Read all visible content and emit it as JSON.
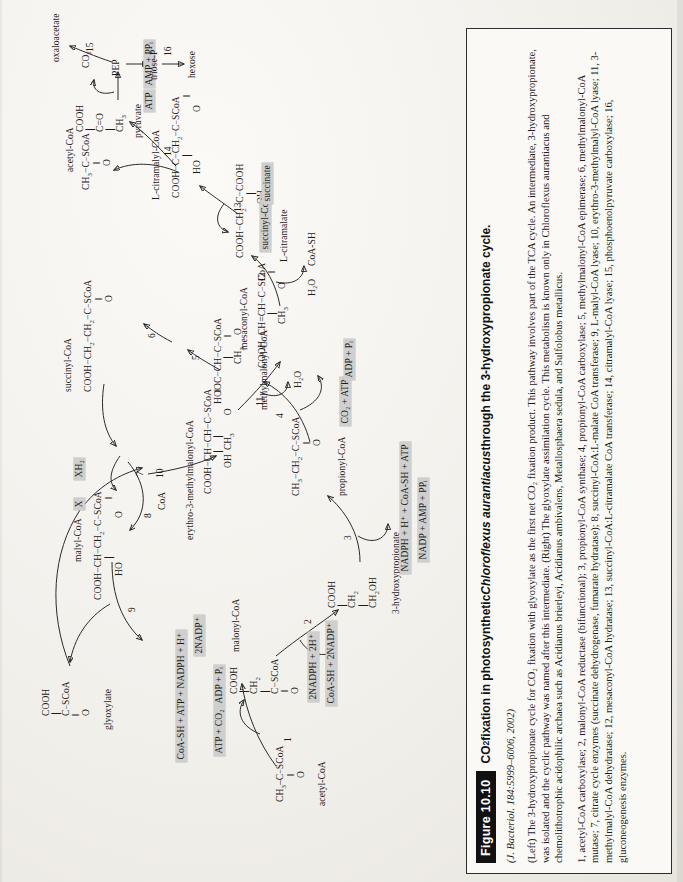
{
  "figure": {
    "badge": "Figure 10.10",
    "title_pre": "CO",
    "title_sub": "2",
    "title_mid": " fixation in photosynthetic ",
    "title_italic": "Chloroflexus aurantiacus",
    "title_post": " through the 3-hydroxypropionate cycle.",
    "source": "(J. Bacteriol. 184:5999–6006, 2002)",
    "paragraph_1": "(Left) The 3-hydroxypropionate cycle for CO₂ fixation with glyoxylate as the first net CO₂ fixation product. This pathway involves part of the TCA cycle. An intermediate, 3-hydroxypropionate, was isolated and the cyclic pathway was named after this intermediate. (Right) The glyoxylate assimilation cycle. This metabolism is known only in Chloroflexus aurantiacus and chemolithotrophic acidophilic archaea such as Acidianus brierleyi, Acidianus ambivalens, Metallosphaera sedula, and Sulfolobus metallicus.",
    "paragraph_2": "1, acetyl-CoA carboxylase; 2, malonyl-CoA reductase (bifunctional); 3, propionyl-CoA synthase; 4, propionyl-CoA carboxylase; 5, methylmalonyl-CoA epimerase; 6, methylmalonyl-CoA mutase; 7, citrate cycle enzymes (succinate dehydrogenase, fumarate hydratase); 8, succinyl-CoA:L-malate CoA transferase; 9, L-malyl-CoA lyase; 10, erythro-3-methylmalyl-CoA lyase; 11, 3-methylmalyl-CoA dehydratase; 12, mesaconyl-CoA hydratase; 13, succinyl-CoA:L-citramalate CoA transferase; 14, citramalyl-CoA lyase; 15, phosphoenolpyruvate carboxylase; 16, gluconeogenesis enzymes."
  },
  "diagram": {
    "metabolites": [
      {
        "id": "acetyl-coa",
        "label": "acetyl-CoA"
      },
      {
        "id": "malonyl-coa",
        "label": "malonyl-CoA"
      },
      {
        "id": "3-hydroxypropionate",
        "label": "3-hydroxypropionate"
      },
      {
        "id": "propionyl-coa",
        "label": "propionyl-CoA"
      },
      {
        "id": "methylmalonyl-coa",
        "label": "methylmalonyl-CoA"
      },
      {
        "id": "succinyl-coa",
        "label": "succinyl-CoA"
      },
      {
        "id": "malyl-coa",
        "label": "malyl-CoA"
      },
      {
        "id": "glyoxylate",
        "label": "glyoxylate"
      },
      {
        "id": "erythro-3-methylmalonyl-coa",
        "label": "erythro-3-methylmalonyl-CoA"
      },
      {
        "id": "mesaconyl-coa",
        "label": "mesaconyl-CoA"
      },
      {
        "id": "l-citramalate",
        "label": "L-citramalate"
      },
      {
        "id": "l-citramalyl-coa",
        "label": "L-citramalyl-CoA"
      },
      {
        "id": "pyruvate",
        "label": "pyruvate"
      },
      {
        "id": "pep",
        "label": "PEP"
      },
      {
        "id": "oxaloacetate",
        "label": "oxaloacetate"
      },
      {
        "id": "triose-p",
        "label": "triose-P"
      },
      {
        "id": "hexose",
        "label": "hexose"
      },
      {
        "id": "succinate-box",
        "label": "succinate"
      },
      {
        "id": "succinyl-coa-box",
        "label": "succinyl-CoA"
      }
    ],
    "cofactors": [
      {
        "id": "cf-atp-co2",
        "label": "ATP + CO₂"
      },
      {
        "id": "cf-adp-pi",
        "label": "ADP + Pᵢ"
      },
      {
        "id": "cf-2nadph-2h",
        "label": "2NADPH + 2H⁺"
      },
      {
        "id": "cf-coash-2nadp",
        "label": "CoA-SH + 2NADP⁺"
      },
      {
        "id": "cf-2nadp",
        "label": "2NADP⁺"
      },
      {
        "id": "cf-nadph-coash-atp",
        "label": "NADPH + H⁺ + CoA-SH + ATP"
      },
      {
        "id": "cf-nadp-amp-ppi",
        "label": "NADP + AMP + PPᵢ"
      },
      {
        "id": "cf-co2-atp",
        "label": "CO₂ + ATP"
      },
      {
        "id": "cf-adp-pi-2",
        "label": "ADP + Pᵢ"
      },
      {
        "id": "cf-xh2",
        "label": "XH₂"
      },
      {
        "id": "cf-x",
        "label": "X"
      },
      {
        "id": "cf-atp",
        "label": "ATP"
      },
      {
        "id": "cf-amp-ppi",
        "label": "AMP + PPᵢ"
      },
      {
        "id": "cf-coa-sh",
        "label": "CoA-SH + ATP + NADPH + H⁺"
      }
    ],
    "small_labels": [
      {
        "id": "h2o-1",
        "label": "H₂O"
      },
      {
        "id": "h2o-2",
        "label": "H₂O"
      },
      {
        "id": "coash-1",
        "label": "CoA-SH"
      },
      {
        "id": "coa-1",
        "label": "CoA"
      },
      {
        "id": "co2-1",
        "label": "CO₂"
      }
    ],
    "enzyme_numbers": [
      "1",
      "2",
      "3",
      "4",
      "5",
      "6",
      "7",
      "8",
      "9",
      "10",
      "11",
      "12",
      "13",
      "14",
      "15",
      "16"
    ]
  }
}
